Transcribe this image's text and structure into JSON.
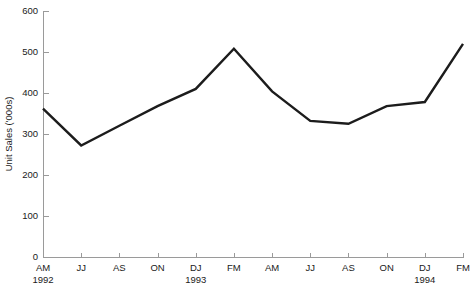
{
  "chart_data": {
    "type": "line",
    "title": "",
    "xlabel": "",
    "ylabel": "Unit Sales ('000s)",
    "ylim": [
      0,
      600
    ],
    "yticks": [
      0,
      100,
      200,
      300,
      400,
      500,
      600
    ],
    "ytick_labels": [
      "0",
      "100",
      "200",
      "300",
      "400",
      "500",
      "600"
    ],
    "grid": false,
    "legend": false,
    "line_color": "#1c1c1c",
    "axis_color": "#9a9a9a",
    "categories": [
      "AM",
      "JJ",
      "AS",
      "ON",
      "DJ",
      "FM",
      "AM",
      "JJ",
      "AS",
      "ON",
      "DJ",
      "FM"
    ],
    "values": [
      362,
      272,
      320,
      368,
      410,
      508,
      404,
      332,
      325,
      368,
      378,
      520
    ],
    "group_labels": [
      {
        "label": "1992",
        "at_category_index": 0
      },
      {
        "label": "1993",
        "at_category_index": 4
      },
      {
        "label": "1994",
        "at_category_index": 10
      }
    ],
    "series": [
      {
        "name": "Unit Sales",
        "points": [
          {
            "x": "AM",
            "year": "1992",
            "y": 362
          },
          {
            "x": "JJ",
            "year": "1992",
            "y": 272
          },
          {
            "x": "AS",
            "year": "1992",
            "y": 320
          },
          {
            "x": "ON",
            "year": "1992",
            "y": 368
          },
          {
            "x": "DJ",
            "year": "1993",
            "y": 410
          },
          {
            "x": "FM",
            "year": "1993",
            "y": 508
          },
          {
            "x": "AM",
            "year": "1993",
            "y": 404
          },
          {
            "x": "JJ",
            "year": "1993",
            "y": 332
          },
          {
            "x": "AS",
            "year": "1993",
            "y": 325
          },
          {
            "x": "ON",
            "year": "1993",
            "y": 368
          },
          {
            "x": "DJ",
            "year": "1994",
            "y": 378
          },
          {
            "x": "FM",
            "year": "1994",
            "y": 520
          }
        ]
      }
    ]
  }
}
